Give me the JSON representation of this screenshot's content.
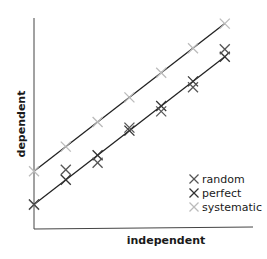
{
  "chart_data": {
    "type": "scatter",
    "title": "",
    "xlabel": "independent",
    "ylabel": "dependent",
    "xlim": [
      0,
      6.3
    ],
    "ylim": [
      0,
      8
    ],
    "grid": false,
    "legend_position": "bottom-right",
    "x": [
      0,
      1,
      2,
      3,
      4,
      5,
      6
    ],
    "series": [
      {
        "name": "random",
        "color": "#555555",
        "marker": "x",
        "values": [
          0.98,
          2.41,
          2.69,
          4.12,
          4.78,
          5.76,
          7.31
        ]
      },
      {
        "name": "perfect",
        "color": "#333333",
        "marker": "x",
        "values": [
          1.0,
          2.0,
          3.0,
          4.0,
          5.0,
          6.0,
          7.0
        ]
      },
      {
        "name": "systematic",
        "color": "#bbbbbb",
        "marker": "x",
        "values": [
          2.35,
          3.35,
          4.35,
          5.35,
          6.35,
          7.35,
          8.35
        ]
      }
    ],
    "fit_lines": [
      {
        "name": "perfect-fit",
        "series": "perfect",
        "color": "#222222"
      },
      {
        "name": "systematic-fit",
        "series": "systematic",
        "color": "#222222"
      }
    ]
  }
}
